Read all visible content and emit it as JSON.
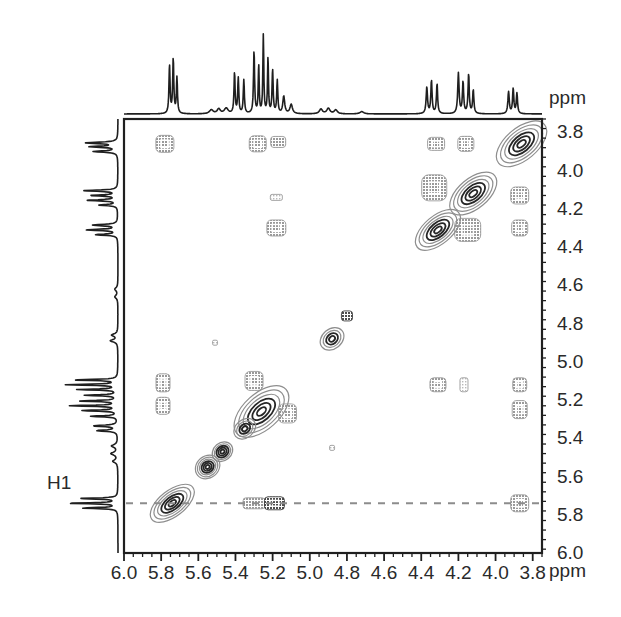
{
  "figure": {
    "type": "2d-nmr-cosy-spectrum",
    "axis_unit": "ppm",
    "x_axis_unit_label": "ppm",
    "y_axis_unit_label": "ppm",
    "x_ticks": [
      "6.0",
      "5.8",
      "5.6",
      "5.4",
      "5.2",
      "5.0",
      "4.8",
      "4.6",
      "4.4",
      "4.2",
      "4.0",
      "3.8"
    ],
    "y_ticks": [
      "3.8",
      "4.0",
      "4.2",
      "4.4",
      "4.6",
      "4.8",
      "5.0",
      "5.2",
      "5.4",
      "5.6",
      "5.8",
      "6.0"
    ],
    "annotations": [
      {
        "label": "H1",
        "x_px": 47,
        "y_px": 482
      }
    ],
    "colors": {
      "frame": "#1f1f1f",
      "trace": "#1f1f1f",
      "contour_dark": "#2b2b2b",
      "contour_mid": "#7d7d7d",
      "contour_light": "#b5b5b5",
      "guide_line": "#8c8c8c",
      "text": "#2a2a2a",
      "background": "#ffffff"
    },
    "guide_line": {
      "y_ppm": 5.74,
      "style": "dashed"
    }
  },
  "chart_data": {
    "type": "heatmap",
    "title": "",
    "xlabel": "ppm",
    "ylabel": "ppm",
    "xlim": [
      6.0,
      3.75
    ],
    "ylim": [
      3.73,
      6.0
    ],
    "grid": false,
    "legend": "none",
    "x_tick_values": [
      6.0,
      5.8,
      5.6,
      5.4,
      5.2,
      5.0,
      4.8,
      4.6,
      4.4,
      4.2,
      4.0,
      3.8
    ],
    "y_tick_values": [
      3.8,
      4.0,
      4.2,
      4.4,
      4.6,
      4.8,
      5.0,
      5.2,
      5.4,
      5.6,
      5.8,
      6.0
    ],
    "minor_tick_step": 0.1,
    "diagonal_peaks": [
      {
        "ppm": 3.86,
        "rx": 30,
        "ry": 16,
        "rot": -40,
        "levels": 6,
        "intensity": "strong"
      },
      {
        "ppm": 4.12,
        "rx": 28,
        "ry": 15,
        "rot": -40,
        "levels": 6,
        "intensity": "strong"
      },
      {
        "ppm": 4.31,
        "rx": 27,
        "ry": 14,
        "rot": -40,
        "levels": 6,
        "intensity": "strong"
      },
      {
        "ppm": 4.88,
        "rx": 13,
        "ry": 10,
        "rot": -40,
        "levels": 4,
        "intensity": "strong"
      },
      {
        "ppm": 5.26,
        "rx": 33,
        "ry": 18,
        "rot": -42,
        "levels": 6,
        "intensity": "strong"
      },
      {
        "ppm": 5.35,
        "rx": 12,
        "ry": 9,
        "rot": -40,
        "levels": 4,
        "intensity": "medium"
      },
      {
        "ppm": 5.47,
        "rx": 11,
        "ry": 9,
        "rot": -40,
        "levels": 5,
        "intensity": "strong"
      },
      {
        "ppm": 5.55,
        "rx": 13,
        "ry": 11,
        "rot": -40,
        "levels": 6,
        "intensity": "strong"
      },
      {
        "ppm": 5.74,
        "rx": 26,
        "ry": 13,
        "rot": -38,
        "levels": 6,
        "intensity": "strong"
      }
    ],
    "cross_peaks": [
      {
        "x_ppm": 5.78,
        "y_ppm": 3.86,
        "w": 18,
        "h": 17,
        "shade": "mid"
      },
      {
        "x_ppm": 5.28,
        "y_ppm": 3.86,
        "w": 17,
        "h": 16,
        "shade": "mid"
      },
      {
        "x_ppm": 5.17,
        "y_ppm": 3.85,
        "w": 15,
        "h": 11,
        "shade": "mid"
      },
      {
        "x_ppm": 4.32,
        "y_ppm": 3.86,
        "w": 17,
        "h": 13,
        "shade": "mid"
      },
      {
        "x_ppm": 4.16,
        "y_ppm": 3.86,
        "w": 16,
        "h": 15,
        "shade": "mid"
      },
      {
        "x_ppm": 4.33,
        "y_ppm": 4.09,
        "w": 25,
        "h": 26,
        "shade": "mid"
      },
      {
        "x_ppm": 3.87,
        "y_ppm": 4.13,
        "w": 18,
        "h": 17,
        "shade": "mid"
      },
      {
        "x_ppm": 4.15,
        "y_ppm": 4.31,
        "w": 26,
        "h": 23,
        "shade": "mid"
      },
      {
        "x_ppm": 3.87,
        "y_ppm": 4.3,
        "w": 16,
        "h": 16,
        "shade": "mid"
      },
      {
        "x_ppm": 5.18,
        "y_ppm": 4.14,
        "w": 12,
        "h": 6,
        "shade": "light"
      },
      {
        "x_ppm": 5.18,
        "y_ppm": 4.3,
        "w": 19,
        "h": 16,
        "shade": "mid"
      },
      {
        "x_ppm": 4.8,
        "y_ppm": 4.76,
        "w": 11,
        "h": 10,
        "shade": "dark"
      },
      {
        "x_ppm": 5.51,
        "y_ppm": 4.9,
        "w": 5,
        "h": 5,
        "shade": "light"
      },
      {
        "x_ppm": 5.79,
        "y_ppm": 5.11,
        "w": 14,
        "h": 18,
        "shade": "mid"
      },
      {
        "x_ppm": 5.79,
        "y_ppm": 5.23,
        "w": 14,
        "h": 17,
        "shade": "mid"
      },
      {
        "x_ppm": 5.3,
        "y_ppm": 5.1,
        "w": 18,
        "h": 19,
        "shade": "mid"
      },
      {
        "x_ppm": 5.12,
        "y_ppm": 5.27,
        "w": 18,
        "h": 19,
        "shade": "mid"
      },
      {
        "x_ppm": 4.31,
        "y_ppm": 5.12,
        "w": 16,
        "h": 14,
        "shade": "mid"
      },
      {
        "x_ppm": 4.17,
        "y_ppm": 5.12,
        "w": 8,
        "h": 14,
        "shade": "light"
      },
      {
        "x_ppm": 3.87,
        "y_ppm": 5.12,
        "w": 14,
        "h": 14,
        "shade": "mid"
      },
      {
        "x_ppm": 3.87,
        "y_ppm": 5.25,
        "w": 15,
        "h": 18,
        "shade": "mid"
      },
      {
        "x_ppm": 4.88,
        "y_ppm": 5.45,
        "w": 5,
        "h": 5,
        "shade": "light"
      },
      {
        "x_ppm": 5.3,
        "y_ppm": 5.74,
        "w": 22,
        "h": 11,
        "shade": "mid"
      },
      {
        "x_ppm": 5.19,
        "y_ppm": 5.74,
        "w": 20,
        "h": 13,
        "shade": "dark"
      },
      {
        "x_ppm": 3.87,
        "y_ppm": 5.74,
        "w": 18,
        "h": 17,
        "shade": "mid"
      }
    ],
    "top_projection": {
      "description": "1D proton spectrum projection along F2 (horizontal) axis",
      "peaks_ppm": [
        5.74,
        5.7,
        5.4,
        5.36,
        5.28,
        5.24,
        5.2,
        5.16,
        5.12,
        5.08,
        4.34,
        4.3,
        4.14,
        4.1,
        3.88,
        3.84
      ]
    },
    "left_projection": {
      "description": "1D proton spectrum projection along F1 (vertical) axis",
      "peaks_ppm": [
        3.86,
        3.9,
        4.12,
        4.16,
        4.3,
        4.34,
        4.88,
        5.1,
        5.14,
        5.2,
        5.26,
        5.34,
        5.46,
        5.56,
        5.72,
        5.76
      ]
    }
  }
}
